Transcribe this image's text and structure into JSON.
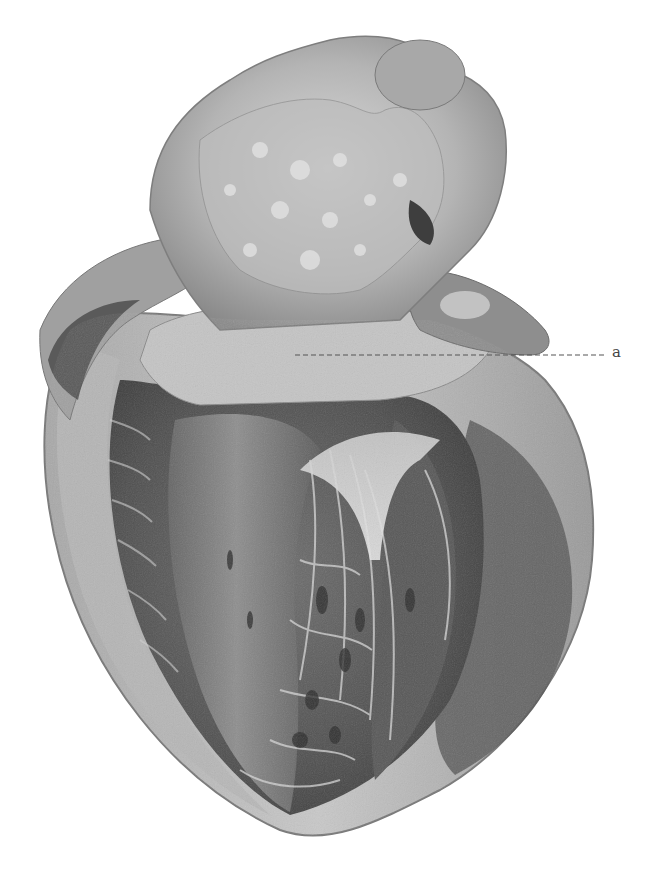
{
  "figure": {
    "style": "grayscale pencil / lithograph",
    "colors": {
      "background": "#ffffff",
      "tissue_light": "#d6d6d6",
      "tissue_mid": "#9a9a9a",
      "tissue_dark": "#5a5a5a",
      "tissue_darkest": "#3a3a3a",
      "leader_line": "#555555",
      "label": "#444444"
    }
  },
  "annotations": [
    {
      "label": "a",
      "leader_line": {
        "x1": 295,
        "y1": 355,
        "x2": 606,
        "y2": 355,
        "style": "dashed"
      },
      "label_position": {
        "x": 615,
        "y": 355
      }
    }
  ],
  "caption": {
    "text": "",
    "note": "faint cut-off text at bottom edge, illegible"
  }
}
